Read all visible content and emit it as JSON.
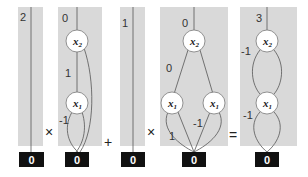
{
  "diagram": {
    "type": "edge-valued decision diagram arithmetic",
    "expression": [
      "panel1",
      "×",
      "panel2",
      "+",
      "panel3",
      "×",
      "panel4",
      "=",
      "panel5"
    ],
    "operators": {
      "op1": "×",
      "op2": "+",
      "op3": "×",
      "op4": "="
    },
    "panels": [
      {
        "id": "panel1",
        "root_weight": "2",
        "nodes": [],
        "terminal": "0"
      },
      {
        "id": "panel2",
        "root_weight": "0",
        "nodes": [
          {
            "label": "x",
            "sub": "2"
          },
          {
            "label": "x",
            "sub": "1"
          }
        ],
        "edge_weights": {
          "x2_to_x1": "1",
          "x1_low": "-1"
        },
        "terminal": "0"
      },
      {
        "id": "panel3",
        "root_weight": "1",
        "nodes": [],
        "terminal": "0"
      },
      {
        "id": "panel4",
        "root_weight": "0",
        "nodes": [
          {
            "label": "x",
            "sub": "2"
          },
          {
            "label": "x",
            "sub": "1"
          },
          {
            "label": "x",
            "sub": "1"
          }
        ],
        "edge_weights": {
          "x2_to_left_x1": "0",
          "left_x1_to_term": "1",
          "right_x1_to_term": "-1"
        },
        "terminal": "0"
      },
      {
        "id": "panel5",
        "root_weight": "3",
        "nodes": [
          {
            "label": "x",
            "sub": "2"
          },
          {
            "label": "x",
            "sub": "1"
          }
        ],
        "edge_weights": {
          "x2_to_x1": "-1",
          "x1_to_term": "-1"
        },
        "terminal": "0"
      }
    ]
  }
}
